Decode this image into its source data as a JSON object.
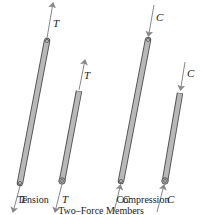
{
  "figure": {
    "caption": "Two–Force Members",
    "groups": [
      {
        "label": "Tension",
        "force_symbol": "T",
        "members": [
          {
            "name": "long",
            "force_labels": [
              "T",
              "T"
            ]
          },
          {
            "name": "short",
            "force_labels": [
              "T",
              "T"
            ]
          }
        ]
      },
      {
        "label": "Compression",
        "force_symbol": "C",
        "members": [
          {
            "name": "long",
            "force_labels": [
              "C",
              "C"
            ]
          },
          {
            "name": "short",
            "force_labels": [
              "C",
              "C"
            ]
          }
        ]
      }
    ]
  },
  "colors": {
    "member_fill": "#b8b8b8",
    "member_stroke": "#555555",
    "arrow": "#888888",
    "text": "#222222"
  }
}
